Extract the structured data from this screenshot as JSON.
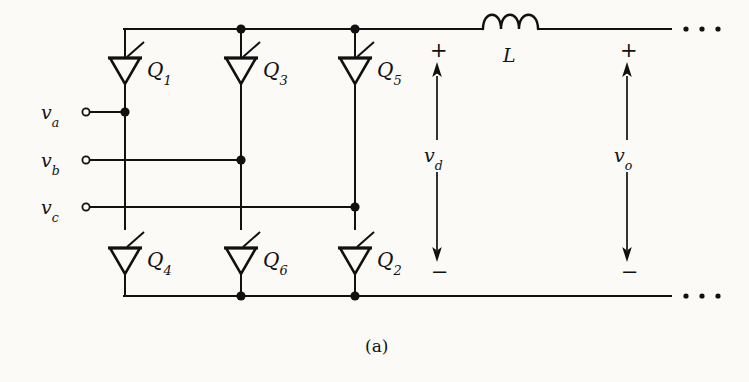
{
  "figure": {
    "caption": "(a)",
    "type": "three-phase thyristor bridge rectifier schematic",
    "background_color": "#fbfaf6",
    "ink_color": "#111111"
  },
  "geometry": {
    "width": 749,
    "height": 382,
    "top_rail_y": 29,
    "bottom_rail_y": 296,
    "left_corner_x": 123,
    "columns_x": [
      125,
      241,
      355
    ],
    "phase_rows_y": [
      112,
      160,
      207
    ],
    "upper_device_y": 68,
    "lower_device_y": 258,
    "rail_right_end_x": 672,
    "inductor_x": [
      483,
      538
    ],
    "vd_arrow_x": 437,
    "vo_arrow_x": 627,
    "arrow_top_y": 62,
    "arrow_bottom_y": 262
  },
  "thyristors": {
    "upper": [
      {
        "id": "Q1",
        "base": "Q",
        "sub": "1",
        "column": 0,
        "label_x": 147,
        "label_y": 60
      },
      {
        "id": "Q3",
        "base": "Q",
        "sub": "3",
        "column": 1,
        "label_x": 263,
        "label_y": 60
      },
      {
        "id": "Q5",
        "base": "Q",
        "sub": "5",
        "column": 2,
        "label_x": 377,
        "label_y": 60
      }
    ],
    "lower": [
      {
        "id": "Q4",
        "base": "Q",
        "sub": "4",
        "column": 0,
        "label_x": 147,
        "label_y": 250
      },
      {
        "id": "Q6",
        "base": "Q",
        "sub": "6",
        "column": 1,
        "label_x": 263,
        "label_y": 250
      },
      {
        "id": "Q2",
        "base": "Q",
        "sub": "2",
        "column": 2,
        "label_x": 377,
        "label_y": 250
      }
    ]
  },
  "input_terminals": [
    {
      "id": "va",
      "base": "v",
      "sub": "a",
      "label_x": 41,
      "label_y": 103,
      "terminal_x": 86,
      "terminal_y": 112,
      "connect_column": 0
    },
    {
      "id": "vb",
      "base": "v",
      "sub": "b",
      "label_x": 41,
      "label_y": 151,
      "terminal_x": 86,
      "terminal_y": 160,
      "connect_column": 1
    },
    {
      "id": "vc",
      "base": "v",
      "sub": "c",
      "label_x": 41,
      "label_y": 198,
      "terminal_x": 86,
      "terminal_y": 207,
      "connect_column": 2
    }
  ],
  "inductor": {
    "label": "L",
    "label_x": 503,
    "label_y": 46,
    "humps": 3
  },
  "voltage_arrows": [
    {
      "id": "vd",
      "base": "v",
      "sub": "d",
      "x": 437,
      "plus_sign": "+",
      "minus_sign": "−",
      "plus_x": 430,
      "plus_y": 48,
      "minus_x": 431,
      "minus_y": 266,
      "label_x": 424,
      "label_y": 155
    },
    {
      "id": "vo",
      "base": "v",
      "sub": "o",
      "x": 627,
      "plus_sign": "+",
      "minus_sign": "−",
      "plus_x": 620,
      "plus_y": 48,
      "minus_x": 621,
      "minus_y": 266,
      "label_x": 614,
      "label_y": 155
    }
  ],
  "ellipsis": [
    {
      "id": "top-ellipsis",
      "y": 29,
      "dots_x": [
        686,
        702,
        718
      ]
    },
    {
      "id": "bottom-ellipsis",
      "y": 296,
      "dots_x": [
        686,
        702,
        718
      ]
    }
  ],
  "junction_dots": [
    {
      "x": 241,
      "y": 29
    },
    {
      "x": 355,
      "y": 29
    },
    {
      "x": 125,
      "y": 112
    },
    {
      "x": 241,
      "y": 160
    },
    {
      "x": 355,
      "y": 207
    },
    {
      "x": 241,
      "y": 296
    },
    {
      "x": 355,
      "y": 296
    }
  ]
}
